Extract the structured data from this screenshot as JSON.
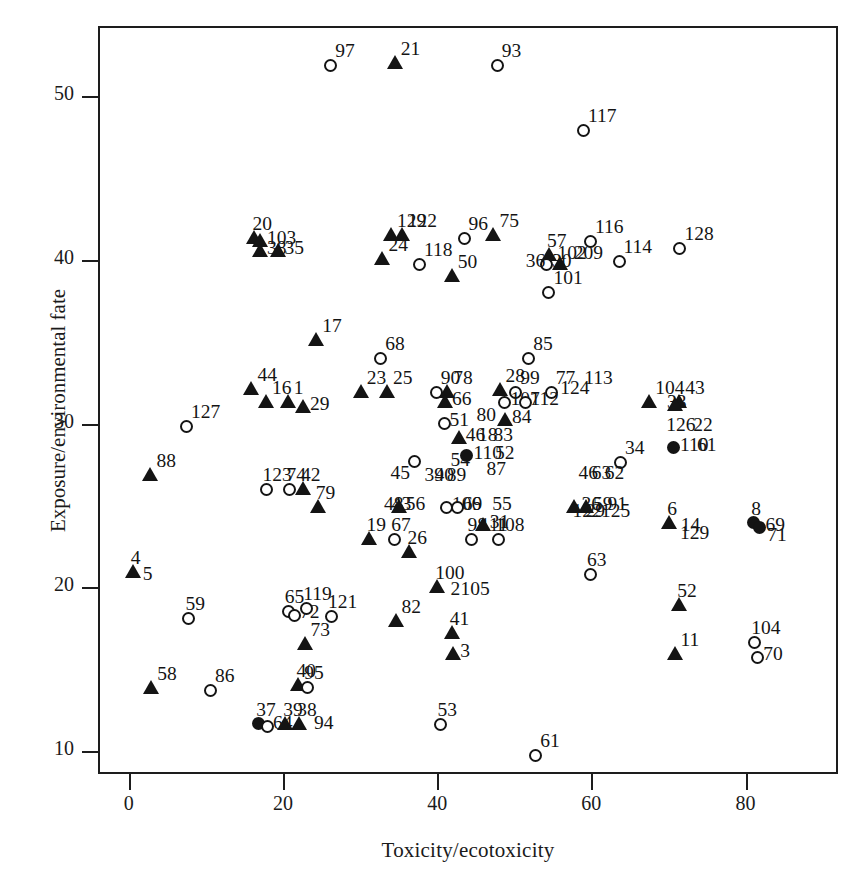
{
  "chart_data": {
    "type": "scatter",
    "title": "",
    "xlabel": "Toxicity/ecotoxicity",
    "ylabel": "Exposure/environmental fate",
    "xlim": [
      -4,
      92
    ],
    "ylim": [
      8.6,
      54.3
    ],
    "xticks": [
      0,
      20,
      40,
      60,
      80
    ],
    "yticks": [
      10,
      20,
      30,
      40,
      50
    ],
    "grid": false,
    "legend": "none",
    "marker_types": [
      "circle",
      "triangle",
      "filled-circle"
    ],
    "points": [
      {
        "label": "97",
        "x": 26.0,
        "y": 52.0,
        "m": "circle",
        "lp": "ne"
      },
      {
        "label": "21",
        "x": 34.5,
        "y": 52.1,
        "m": "tri",
        "lp": "ne"
      },
      {
        "label": "93",
        "x": 47.6,
        "y": 52.0,
        "m": "circle",
        "lp": "ne"
      },
      {
        "label": "117",
        "x": 58.8,
        "y": 48.0,
        "m": "circle",
        "lp": "ne"
      },
      {
        "label": "20",
        "x": 16.3,
        "y": 41.4,
        "m": "tri",
        "lp": "n"
      },
      {
        "label": "103",
        "x": 17.0,
        "y": 41.2,
        "m": "tri",
        "lp": "e"
      },
      {
        "label": "38",
        "x": 17.0,
        "y": 40.6,
        "m": "tri",
        "lp": "e"
      },
      {
        "label": "35",
        "x": 19.3,
        "y": 40.6,
        "m": "tri",
        "lp": "e"
      },
      {
        "label": "129",
        "x": 34.0,
        "y": 41.6,
        "m": "tri",
        "lp": "ne"
      },
      {
        "label": "122",
        "x": 35.4,
        "y": 41.6,
        "m": "tri",
        "lp": "ne"
      },
      {
        "label": "96",
        "x": 43.3,
        "y": 41.4,
        "m": "circle",
        "lp": "ne"
      },
      {
        "label": "75",
        "x": 47.3,
        "y": 41.6,
        "m": "tri",
        "lp": "ne"
      },
      {
        "label": "116",
        "x": 59.7,
        "y": 41.2,
        "m": "circle",
        "lp": "ne"
      },
      {
        "label": "128",
        "x": 71.3,
        "y": 40.8,
        "m": "circle",
        "lp": "ne"
      },
      {
        "label": "57",
        "x": 54.5,
        "y": 40.4,
        "m": "tri",
        "lp": "n"
      },
      {
        "label": "102",
        "x": 54.7,
        "y": 40.3,
        "m": "e-lbl",
        "lp": "e"
      },
      {
        "label": "209",
        "x": 56.8,
        "y": 40.3,
        "m": "none",
        "lp": "e"
      },
      {
        "label": "114",
        "x": 63.4,
        "y": 40.0,
        "m": "circle",
        "lp": "ne"
      },
      {
        "label": "24",
        "x": 32.9,
        "y": 40.1,
        "m": "tri",
        "lp": "ne"
      },
      {
        "label": "118",
        "x": 37.5,
        "y": 39.8,
        "m": "circle",
        "lp": "ne"
      },
      {
        "label": "50",
        "x": 41.9,
        "y": 39.1,
        "m": "tri",
        "lp": "ne"
      },
      {
        "label": "30",
        "x": 54.0,
        "y": 39.8,
        "m": "circle",
        "lp": "e"
      },
      {
        "label": "36",
        "x": 55.9,
        "y": 39.8,
        "m": "tri",
        "lp": "w"
      },
      {
        "label": "101",
        "x": 54.3,
        "y": 38.1,
        "m": "circle",
        "lp": "ne"
      },
      {
        "label": "17",
        "x": 24.3,
        "y": 35.2,
        "m": "tri",
        "lp": "ne"
      },
      {
        "label": "68",
        "x": 32.5,
        "y": 34.1,
        "m": "circle",
        "lp": "ne"
      },
      {
        "label": "85",
        "x": 51.7,
        "y": 34.1,
        "m": "circle",
        "lp": "ne"
      },
      {
        "label": "44",
        "x": 15.9,
        "y": 32.2,
        "m": "tri",
        "lp": "ne"
      },
      {
        "label": "16",
        "x": 17.8,
        "y": 31.4,
        "m": "tri",
        "lp": "ne"
      },
      {
        "label": "23",
        "x": 30.1,
        "y": 32.0,
        "m": "tri",
        "lp": "ne"
      },
      {
        "label": "25",
        "x": 33.5,
        "y": 32.0,
        "m": "tri",
        "lp": "ne"
      },
      {
        "label": "90",
        "x": 39.7,
        "y": 32.0,
        "m": "circle",
        "lp": "ne"
      },
      {
        "label": "78",
        "x": 41.3,
        "y": 32.0,
        "m": "tri",
        "lp": "ne"
      },
      {
        "label": "28",
        "x": 48.1,
        "y": 32.1,
        "m": "tri",
        "lp": "ne"
      },
      {
        "label": "99",
        "x": 50.0,
        "y": 32.0,
        "m": "circle",
        "lp": "ne"
      },
      {
        "label": "77",
        "x": 54.6,
        "y": 32.0,
        "m": "circle",
        "lp": "ne"
      },
      {
        "label": "113",
        "x": 58.3,
        "y": 32.0,
        "m": "none",
        "lp": "ne"
      },
      {
        "label": "1",
        "x": 20.6,
        "y": 31.4,
        "m": "tri",
        "lp": "ne"
      },
      {
        "label": "29",
        "x": 22.6,
        "y": 31.1,
        "m": "tri",
        "lp": "e"
      },
      {
        "label": "66",
        "x": 41.0,
        "y": 31.4,
        "m": "tri",
        "lp": "e"
      },
      {
        "label": "107",
        "x": 48.6,
        "y": 31.4,
        "m": "circle",
        "lp": "e"
      },
      {
        "label": "112",
        "x": 51.2,
        "y": 31.4,
        "m": "circle",
        "lp": "e"
      },
      {
        "label": "124",
        "x": 55.2,
        "y": 31.4,
        "m": "none",
        "lp": "ne"
      },
      {
        "label": "104",
        "x": 67.5,
        "y": 31.4,
        "m": "tri",
        "lp": "ne"
      },
      {
        "label": "43",
        "x": 71.4,
        "y": 31.4,
        "m": "tri",
        "lp": "ne"
      },
      {
        "label": "33",
        "x": 68.9,
        "y": 31.2,
        "m": "none",
        "lp": "e"
      },
      {
        "label": "44b",
        "x": 70.9,
        "y": 31.2,
        "m": "tri",
        "lp": "none"
      },
      {
        "label": "127",
        "x": 7.3,
        "y": 29.9,
        "m": "circle",
        "lp": "ne"
      },
      {
        "label": "51",
        "x": 40.7,
        "y": 30.1,
        "m": "circle",
        "lp": "e"
      },
      {
        "label": "80",
        "x": 44.2,
        "y": 30.4,
        "m": "none",
        "lp": "e"
      },
      {
        "label": "84",
        "x": 48.8,
        "y": 30.3,
        "m": "tri",
        "lp": "e"
      },
      {
        "label": "126",
        "x": 68.8,
        "y": 29.8,
        "m": "none",
        "lp": "e"
      },
      {
        "label": "22",
        "x": 72.3,
        "y": 29.8,
        "m": "none",
        "lp": "e"
      },
      {
        "label": "46",
        "x": 42.8,
        "y": 29.2,
        "m": "tri",
        "lp": "e"
      },
      {
        "label": "18",
        "x": 44.4,
        "y": 29.2,
        "m": "none",
        "lp": "e"
      },
      {
        "label": "83",
        "x": 46.4,
        "y": 29.2,
        "m": "none",
        "lp": "e"
      },
      {
        "label": "110",
        "x": 70.6,
        "y": 28.6,
        "m": "filled",
        "lp": "e"
      },
      {
        "label": "61b",
        "x": 72.8,
        "y": 28.6,
        "m": "none",
        "lp": "e"
      },
      {
        "label": "110c",
        "x": 43.8,
        "y": 28.1,
        "m": "filled",
        "lp": "e"
      },
      {
        "label": "52",
        "x": 46.6,
        "y": 28.1,
        "m": "none",
        "lp": "e"
      },
      {
        "label": "15",
        "x": 36.8,
        "y": 27.8,
        "m": "circle",
        "lp": "none"
      },
      {
        "label": "87",
        "x": 45.5,
        "y": 27.1,
        "m": "none",
        "lp": "e"
      },
      {
        "label": "54",
        "x": 42.0,
        "y": 27.0,
        "m": "n-lbl",
        "lp": "n"
      },
      {
        "label": "34",
        "x": 63.6,
        "y": 27.7,
        "m": "circle",
        "lp": "ne"
      },
      {
        "label": "88",
        "x": 2.8,
        "y": 26.9,
        "m": "tri",
        "lp": "ne"
      },
      {
        "label": "123",
        "x": 17.6,
        "y": 26.1,
        "m": "circle",
        "lp": "n"
      },
      {
        "label": "74",
        "x": 20.7,
        "y": 26.1,
        "m": "circle",
        "lp": "n"
      },
      {
        "label": "42",
        "x": 22.6,
        "y": 26.1,
        "m": "tri",
        "lp": "n"
      },
      {
        "label": "45",
        "x": 34.2,
        "y": 26.2,
        "m": "n-lbl",
        "lp": "n"
      },
      {
        "label": "39",
        "x": 38.6,
        "y": 26.1,
        "m": "none",
        "lp": "n"
      },
      {
        "label": "40",
        "x": 39.9,
        "y": 26.1,
        "m": "none",
        "lp": "n"
      },
      {
        "label": "89",
        "x": 41.5,
        "y": 26.1,
        "m": "none",
        "lp": "n"
      },
      {
        "label": "46b",
        "x": 58.6,
        "y": 26.2,
        "m": "none",
        "lp": "n"
      },
      {
        "label": "63",
        "x": 60.3,
        "y": 26.2,
        "m": "none",
        "lp": "n"
      },
      {
        "label": "62",
        "x": 62.0,
        "y": 26.2,
        "m": "none",
        "lp": "n"
      },
      {
        "label": "79",
        "x": 24.5,
        "y": 25.0,
        "m": "tri",
        "lp": "n"
      },
      {
        "label": "48",
        "x": 32.2,
        "y": 25.0,
        "m": "e-lbl",
        "lp": "e"
      },
      {
        "label": "43b",
        "x": 33.2,
        "y": 25.0,
        "m": "none",
        "lp": "e"
      },
      {
        "label": "56",
        "x": 35.0,
        "y": 25.0,
        "m": "tri",
        "lp": "e"
      },
      {
        "label": "106",
        "x": 41.0,
        "y": 25.0,
        "m": "circle",
        "lp": "e"
      },
      {
        "label": "69",
        "x": 42.4,
        "y": 25.0,
        "m": "circle",
        "lp": "e"
      },
      {
        "label": "36b",
        "x": 57.8,
        "y": 25.0,
        "m": "tri",
        "lp": "e"
      },
      {
        "label": "59b",
        "x": 59.3,
        "y": 25.0,
        "m": "tri",
        "lp": "e"
      },
      {
        "label": "91",
        "x": 61.2,
        "y": 25.0,
        "m": "none",
        "lp": "e"
      },
      {
        "label": "55",
        "x": 47.4,
        "y": 24.3,
        "m": "none",
        "lp": "n"
      },
      {
        "label": "31",
        "x": 45.9,
        "y": 23.9,
        "m": "tri",
        "lp": "e"
      },
      {
        "label": "122b",
        "x": 57.8,
        "y": 23.9,
        "m": "none",
        "lp": "n"
      },
      {
        "label": "29b",
        "x": 59.5,
        "y": 23.9,
        "m": "none",
        "lp": "n"
      },
      {
        "label": "125",
        "x": 61.5,
        "y": 23.9,
        "m": "none",
        "lp": "n"
      },
      {
        "label": "6",
        "x": 70.1,
        "y": 24.0,
        "m": "tri",
        "lp": "n"
      },
      {
        "label": "14",
        "x": 70.7,
        "y": 23.7,
        "m": "none",
        "lp": "e"
      },
      {
        "label": "8",
        "x": 81.0,
        "y": 24.0,
        "m": "filled",
        "lp": "n"
      },
      {
        "label": "69b",
        "x": 81.7,
        "y": 23.7,
        "m": "filled",
        "lp": "e"
      },
      {
        "label": "71",
        "x": 81.9,
        "y": 23.1,
        "m": "none",
        "lp": "e"
      },
      {
        "label": "129b",
        "x": 70.6,
        "y": 23.2,
        "m": "none",
        "lp": "e"
      },
      {
        "label": "19",
        "x": 31.1,
        "y": 23.0,
        "m": "tri",
        "lp": "n"
      },
      {
        "label": "67",
        "x": 34.3,
        "y": 23.0,
        "m": "circle",
        "lp": "n"
      },
      {
        "label": "98",
        "x": 44.2,
        "y": 23.0,
        "m": "circle",
        "lp": "n"
      },
      {
        "label": "111",
        "x": 45.8,
        "y": 23.0,
        "m": "none",
        "lp": "n"
      },
      {
        "label": "108",
        "x": 47.8,
        "y": 23.0,
        "m": "circle",
        "lp": "n"
      },
      {
        "label": "26",
        "x": 36.4,
        "y": 22.2,
        "m": "tri",
        "lp": "n"
      },
      {
        "label": "63b",
        "x": 59.7,
        "y": 20.9,
        "m": "circle",
        "lp": "n"
      },
      {
        "label": "4",
        "x": 0.5,
        "y": 21.0,
        "m": "tri",
        "lp": "n"
      },
      {
        "label": "5",
        "x": 0.9,
        "y": 20.7,
        "m": "none",
        "lp": "e"
      },
      {
        "label": "100",
        "x": 40.0,
        "y": 20.1,
        "m": "tri",
        "lp": "n"
      },
      {
        "label": "65",
        "x": 20.5,
        "y": 18.6,
        "m": "circle",
        "lp": "n"
      },
      {
        "label": "72",
        "x": 21.3,
        "y": 18.4,
        "m": "circle",
        "lp": "e"
      },
      {
        "label": "119",
        "x": 22.9,
        "y": 18.8,
        "m": "circle",
        "lp": "n"
      },
      {
        "label": "121",
        "x": 26.1,
        "y": 18.3,
        "m": "circle",
        "lp": "n"
      },
      {
        "label": "59",
        "x": 7.6,
        "y": 18.2,
        "m": "circle",
        "lp": "n"
      },
      {
        "label": "2",
        "x": 42.0,
        "y": 19.1,
        "m": "none",
        "lp": "n"
      },
      {
        "label": "105",
        "x": 43.3,
        "y": 19.1,
        "m": "none",
        "lp": "n"
      },
      {
        "label": "52b",
        "x": 71.4,
        "y": 19.0,
        "m": "tri",
        "lp": "n"
      },
      {
        "label": "82",
        "x": 34.6,
        "y": 18.0,
        "m": "tri",
        "lp": "ne"
      },
      {
        "label": "41",
        "x": 41.9,
        "y": 17.3,
        "m": "tri",
        "lp": "n"
      },
      {
        "label": "73",
        "x": 22.8,
        "y": 16.6,
        "m": "tri",
        "lp": "ne"
      },
      {
        "label": "3",
        "x": 42.1,
        "y": 16.0,
        "m": "tri",
        "lp": "e"
      },
      {
        "label": "11",
        "x": 70.8,
        "y": 16.0,
        "m": "tri",
        "lp": "ne"
      },
      {
        "label": "104b",
        "x": 81.0,
        "y": 16.7,
        "m": "circle",
        "lp": "n"
      },
      {
        "label": "70",
        "x": 81.4,
        "y": 15.8,
        "m": "circle",
        "lp": "e"
      },
      {
        "label": "58",
        "x": 2.9,
        "y": 13.9,
        "m": "tri",
        "lp": "ne"
      },
      {
        "label": "86",
        "x": 10.4,
        "y": 13.8,
        "m": "circle",
        "lp": "ne"
      },
      {
        "label": "40b",
        "x": 22.0,
        "y": 14.1,
        "m": "tri",
        "lp": "n"
      },
      {
        "label": "95",
        "x": 23.0,
        "y": 14.0,
        "m": "circle",
        "lp": "n"
      },
      {
        "label": "37",
        "x": 16.8,
        "y": 11.7,
        "m": "filled",
        "lp": "n"
      },
      {
        "label": "64",
        "x": 17.8,
        "y": 11.6,
        "m": "circle",
        "lp": "e"
      },
      {
        "label": "39b",
        "x": 20.3,
        "y": 11.7,
        "m": "tri",
        "lp": "n"
      },
      {
        "label": "38b",
        "x": 22.1,
        "y": 11.7,
        "m": "tri",
        "lp": "n"
      },
      {
        "label": "94",
        "x": 23.1,
        "y": 11.6,
        "m": "none",
        "lp": "e"
      },
      {
        "label": "53",
        "x": 40.3,
        "y": 11.7,
        "m": "circle",
        "lp": "n"
      },
      {
        "label": "61",
        "x": 52.6,
        "y": 9.8,
        "m": "circle",
        "lp": "ne"
      }
    ]
  }
}
